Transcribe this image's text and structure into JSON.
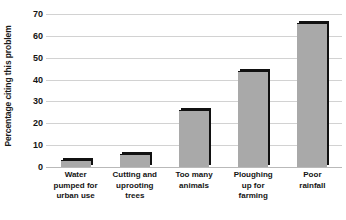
{
  "chart_data": {
    "type": "bar",
    "title": "",
    "xlabel": "",
    "ylabel": "Percentage citing this problem",
    "ylim": [
      0,
      70
    ],
    "ytick_step": 10,
    "yticks": [
      70,
      60,
      50,
      40,
      30,
      20,
      10,
      0
    ],
    "grid": true,
    "legend": false,
    "categories": [
      "Water pumped for urban use",
      "Cutting and uprooting trees",
      "Too many animals",
      "Ploughing up for farming",
      "Poor rainfall"
    ],
    "category_lines": [
      [
        "Water",
        "pumped for",
        "urban use"
      ],
      [
        "Cutting and",
        "uprooting",
        "trees"
      ],
      [
        "Too many",
        "animals"
      ],
      [
        "Ploughing",
        "up for",
        "farming"
      ],
      [
        "Poor",
        "rainfall"
      ]
    ],
    "values": [
      3,
      6,
      26,
      44,
      66
    ],
    "colors": {
      "bar_fill": "#a9a9a9",
      "bar_shadow": "#111111",
      "gridline": "#d2d2d2",
      "axis": "#b9b9b9",
      "text": "#141414",
      "background": "#ffffff"
    }
  }
}
